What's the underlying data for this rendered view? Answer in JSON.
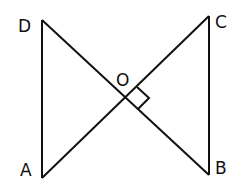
{
  "diagram": {
    "type": "geometry",
    "stroke_color": "#111111",
    "background": "#ffffff",
    "points": {
      "A": {
        "label": "A",
        "x": 42,
        "y": 178
      },
      "B": {
        "label": "B",
        "x": 209,
        "y": 175
      },
      "C": {
        "label": "C",
        "x": 209,
        "y": 16
      },
      "D": {
        "label": "D",
        "x": 42,
        "y": 20
      },
      "O": {
        "label": "O",
        "x": 125,
        "y": 98
      }
    },
    "segments": [
      "AD",
      "BC",
      "AC",
      "BD"
    ],
    "annotations": [
      {
        "type": "right-angle-marker",
        "at": "O",
        "between": [
          "OC",
          "OB"
        ]
      }
    ]
  }
}
